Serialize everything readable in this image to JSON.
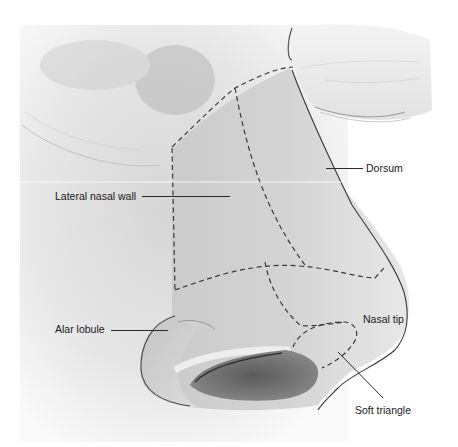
{
  "figure": {
    "labels": [
      {
        "id": "lateral-nasal-wall",
        "text": "Lateral nasal wall",
        "x": 55,
        "y": 190,
        "leader": {
          "x1": 142,
          "x2": 230,
          "y": 196
        }
      },
      {
        "id": "dorsum",
        "text": "Dorsum",
        "x": 366,
        "y": 162,
        "leader": {
          "x1": 326,
          "x2": 363,
          "y": 168
        }
      },
      {
        "id": "alar-lobule",
        "text": "Alar lobule",
        "x": 55,
        "y": 322,
        "leader": {
          "x1": 111,
          "x2": 168,
          "y": 330
        }
      },
      {
        "id": "nasal-tip",
        "text": "Nasal tip",
        "x": 364,
        "y": 313
      },
      {
        "id": "soft-triangle",
        "text": "Soft triangle",
        "x": 355,
        "y": 405
      }
    ],
    "colors": {
      "line": "#2a2a2a",
      "dash": "#3a3a3a",
      "shade": "#9a9a9a",
      "background": "#ffffff"
    }
  }
}
